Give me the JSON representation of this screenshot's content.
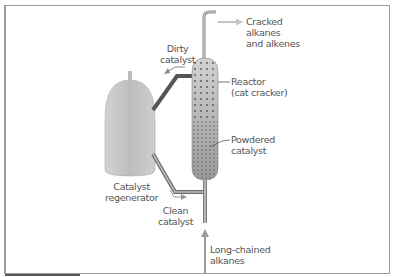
{
  "diagram": {
    "type": "process-flow",
    "labels": {
      "cracked": "Cracked\nalkanes\nand alkenes",
      "dirty": "Dirty\ncatalyst",
      "reactor": "Reactor\n(cat cracker)",
      "powdered": "Powdered\ncatalyst",
      "regenerator": "Catalyst\nregenerator",
      "clean": "Clean\ncatalyst",
      "feed": "Long-chained\nalkanes"
    },
    "colors": {
      "vessel_fill": "#c8c8c8",
      "reactor_fill": "#a9a9a9",
      "pipe": "#6e6e6e",
      "arrow": "#b8b8b8",
      "text": "#555555",
      "frame": "#9a9a9a"
    },
    "nodes": [
      {
        "id": "regenerator",
        "label": "Catalyst regenerator"
      },
      {
        "id": "reactor",
        "label": "Reactor (cat cracker)"
      }
    ],
    "edges": [
      {
        "from": "reactor",
        "to": "regenerator",
        "label": "Dirty catalyst"
      },
      {
        "from": "regenerator",
        "to": "reactor",
        "label": "Clean catalyst"
      },
      {
        "from": "feed",
        "to": "reactor",
        "label": "Long-chained alkanes"
      },
      {
        "from": "reactor",
        "to": "output",
        "label": "Cracked alkanes and alkenes"
      }
    ]
  }
}
